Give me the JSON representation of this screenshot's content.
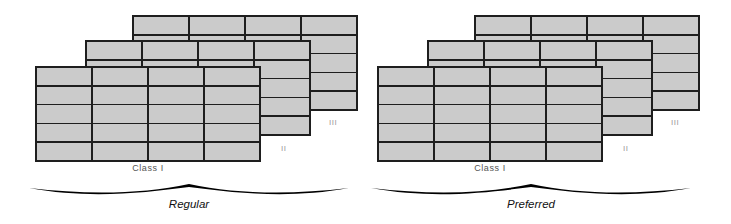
{
  "figure": {
    "background": "#ffffff",
    "cell_fill": "#cbcbcb",
    "line_color": "#1e1e1e",
    "front_label_color": "#555555",
    "back_label_color": "#9b9b9b",
    "brace_color": "#000000",
    "brace_label_color": "#111111"
  },
  "groups": [
    {
      "id": "regular",
      "brace_label": "Regular",
      "layers": [
        {
          "label": "III",
          "rows": 5,
          "cols": 4
        },
        {
          "label": "II",
          "rows": 5,
          "cols": 4
        },
        {
          "label": "Class I",
          "rows": 5,
          "cols": 4
        }
      ]
    },
    {
      "id": "preferred",
      "brace_label": "Preferred",
      "layers": [
        {
          "label": "III",
          "rows": 5,
          "cols": 4
        },
        {
          "label": "II",
          "rows": 5,
          "cols": 4
        },
        {
          "label": "Class I",
          "rows": 5,
          "cols": 4
        }
      ]
    }
  ]
}
